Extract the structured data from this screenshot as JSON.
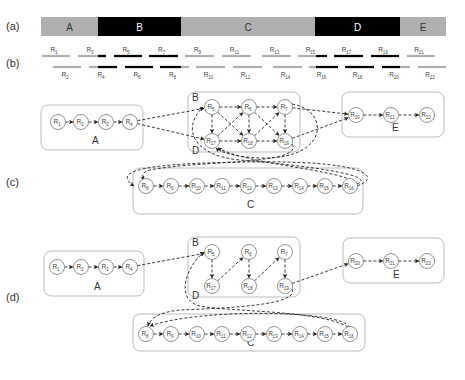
{
  "panels": {
    "a": {
      "label": "(a)",
      "bar": {
        "y": 17,
        "height": 19
      },
      "segments": [
        {
          "name": "A",
          "x0": 41,
          "x1": 98,
          "color": "#b0b0b0",
          "text_color": "#333333"
        },
        {
          "name": "B",
          "x0": 98,
          "x1": 181,
          "color": "#000000",
          "text_color": "#ffffff"
        },
        {
          "name": "C",
          "x0": 181,
          "x1": 315,
          "color": "#b0b0b0",
          "text_color": "#333333"
        },
        {
          "name": "D",
          "x0": 315,
          "x1": 400,
          "color": "#000000",
          "text_color": "#ffffff"
        },
        {
          "name": "E",
          "x0": 400,
          "x1": 446,
          "color": "#b0b0b0",
          "text_color": "#333333"
        }
      ]
    },
    "b": {
      "label": "(b)",
      "colors": {
        "repeat": "#000000",
        "unique": "#b0b0b0"
      },
      "reads": [
        {
          "id": "R",
          "sub": "1",
          "row": 0,
          "x0": 42,
          "x1": 70,
          "black": []
        },
        {
          "id": "R",
          "sub": "3",
          "row": 0,
          "x0": 78,
          "x1": 106,
          "black": [
            [
              98,
              106
            ]
          ]
        },
        {
          "id": "R",
          "sub": "5",
          "row": 0,
          "x0": 114,
          "x1": 142,
          "black": [
            [
              114,
              142
            ]
          ]
        },
        {
          "id": "R",
          "sub": "7",
          "row": 0,
          "x0": 149,
          "x1": 178,
          "black": [
            [
              149,
              178
            ]
          ]
        },
        {
          "id": "R",
          "sub": "9",
          "row": 0,
          "x0": 185,
          "x1": 214,
          "black": []
        },
        {
          "id": "R",
          "sub": "11",
          "row": 0,
          "x0": 222,
          "x1": 251,
          "black": []
        },
        {
          "id": "R",
          "sub": "13",
          "row": 0,
          "x0": 262,
          "x1": 291,
          "black": []
        },
        {
          "id": "R",
          "sub": "15",
          "row": 0,
          "x0": 298,
          "x1": 327,
          "black": [
            [
              316,
              327
            ]
          ]
        },
        {
          "id": "R",
          "sub": "17",
          "row": 0,
          "x0": 334,
          "x1": 363,
          "black": [
            [
              334,
              363
            ]
          ]
        },
        {
          "id": "R",
          "sub": "19",
          "row": 0,
          "x0": 371,
          "x1": 399,
          "black": [
            [
              371,
              399
            ]
          ]
        },
        {
          "id": "R",
          "sub": "21",
          "row": 0,
          "x0": 407,
          "x1": 435,
          "black": []
        },
        {
          "id": "R",
          "sub": "2",
          "row": 1,
          "x0": 53,
          "x1": 81,
          "black": []
        },
        {
          "id": "R",
          "sub": "4",
          "row": 1,
          "x0": 89,
          "x1": 117,
          "black": [
            [
              98,
              117
            ]
          ]
        },
        {
          "id": "R",
          "sub": "6",
          "row": 1,
          "x0": 125,
          "x1": 153,
          "black": [
            [
              125,
              153
            ]
          ]
        },
        {
          "id": "R",
          "sub": "8",
          "row": 1,
          "x0": 160,
          "x1": 189,
          "black": [
            [
              160,
              181
            ]
          ]
        },
        {
          "id": "R",
          "sub": "10",
          "row": 1,
          "x0": 196,
          "x1": 225,
          "black": []
        },
        {
          "id": "R",
          "sub": "12",
          "row": 1,
          "x0": 233,
          "x1": 262,
          "black": []
        },
        {
          "id": "R",
          "sub": "14",
          "row": 1,
          "x0": 273,
          "x1": 302,
          "black": []
        },
        {
          "id": "R",
          "sub": "16",
          "row": 1,
          "x0": 309,
          "x1": 338,
          "black": [
            [
              316,
              338
            ]
          ]
        },
        {
          "id": "R",
          "sub": "18",
          "row": 1,
          "x0": 345,
          "x1": 374,
          "black": [
            [
              345,
              374
            ]
          ]
        },
        {
          "id": "R",
          "sub": "20",
          "row": 1,
          "x0": 382,
          "x1": 410,
          "black": [
            [
              382,
              400
            ]
          ]
        },
        {
          "id": "R",
          "sub": "22",
          "row": 1,
          "x0": 418,
          "x1": 446,
          "black": []
        }
      ]
    },
    "c": {
      "label": "(c)",
      "groups": [
        {
          "name": "A",
          "x": 41,
          "y": 105,
          "w": 102,
          "h": 45,
          "lx": 92,
          "ly": 144
        },
        {
          "name": "B",
          "x": 188,
          "y": 92,
          "w": 112,
          "h": 60,
          "lx": 192,
          "ly": 101
        },
        {
          "name": "D",
          "x": 188,
          "y": 92,
          "w": 112,
          "h": 60,
          "lx": 192,
          "ly": 154,
          "hide_box": true
        },
        {
          "name": "E",
          "x": 342,
          "y": 92,
          "w": 102,
          "h": 45,
          "lx": 392,
          "ly": 131
        },
        {
          "name": "C",
          "x": 133,
          "y": 168,
          "w": 230,
          "h": 46,
          "lx": 247,
          "ly": 208
        }
      ],
      "nodes": [
        {
          "key": "1",
          "sub": "1",
          "x": 58,
          "y": 122
        },
        {
          "key": "2",
          "sub": "2",
          "x": 81,
          "y": 122
        },
        {
          "key": "3",
          "sub": "3",
          "x": 106,
          "y": 122
        },
        {
          "key": "4",
          "sub": "4",
          "x": 130,
          "y": 122
        },
        {
          "key": "5",
          "sub": "5",
          "x": 212,
          "y": 107
        },
        {
          "key": "6",
          "sub": "6",
          "x": 249,
          "y": 107
        },
        {
          "key": "7",
          "sub": "7",
          "x": 285,
          "y": 107
        },
        {
          "key": "17",
          "sub": "17",
          "x": 212,
          "y": 141
        },
        {
          "key": "18",
          "sub": "18",
          "x": 249,
          "y": 141
        },
        {
          "key": "19",
          "sub": "19",
          "x": 285,
          "y": 141
        },
        {
          "key": "20",
          "sub": "20",
          "x": 356,
          "y": 115
        },
        {
          "key": "21",
          "sub": "21",
          "x": 391,
          "y": 115
        },
        {
          "key": "22",
          "sub": "22",
          "x": 427,
          "y": 115
        },
        {
          "key": "8",
          "sub": "8",
          "x": 146,
          "y": 186
        },
        {
          "key": "9",
          "sub": "9",
          "x": 171,
          "y": 186
        },
        {
          "key": "10",
          "sub": "10",
          "x": 197,
          "y": 186
        },
        {
          "key": "11",
          "sub": "11",
          "x": 222,
          "y": 186
        },
        {
          "key": "12",
          "sub": "12",
          "x": 248,
          "y": 186
        },
        {
          "key": "13",
          "sub": "13",
          "x": 274,
          "y": 186
        },
        {
          "key": "14",
          "sub": "14",
          "x": 300,
          "y": 186
        },
        {
          "key": "15",
          "sub": "15",
          "x": 325,
          "y": 186
        },
        {
          "key": "16",
          "sub": "16",
          "x": 350,
          "y": 186
        }
      ],
      "edges": [
        [
          "1",
          "2"
        ],
        [
          "2",
          "3"
        ],
        [
          "3",
          "4"
        ],
        [
          "4",
          "5"
        ],
        [
          "4",
          "17"
        ],
        [
          "5",
          "6"
        ],
        [
          "6",
          "7"
        ],
        [
          "5",
          "17"
        ],
        [
          "6",
          "18"
        ],
        [
          "7",
          "19"
        ],
        [
          "17",
          "18"
        ],
        [
          "18",
          "19"
        ],
        [
          "5",
          "18"
        ],
        [
          "17",
          "6"
        ],
        [
          "6",
          "19"
        ],
        [
          "18",
          "7"
        ],
        [
          "7",
          "20"
        ],
        [
          "19",
          "20"
        ],
        [
          "20",
          "21"
        ],
        [
          "21",
          "22"
        ],
        [
          "8",
          "9"
        ],
        [
          "9",
          "10"
        ],
        [
          "10",
          "11"
        ],
        [
          "11",
          "12"
        ],
        [
          "12",
          "13"
        ],
        [
          "13",
          "14"
        ],
        [
          "14",
          "15"
        ],
        [
          "15",
          "16"
        ]
      ],
      "curves": [
        {
          "name": "16-to-8-loop",
          "d": "M 357 186 C 385 176, 360 160, 250 162 C 150 163, 110 170, 134 186"
        },
        {
          "name": "16-to-5",
          "d": "M 357 184 C 380 175, 300 165, 240 160 C 195 156, 180 130, 203 107"
        },
        {
          "name": "19-to-8",
          "d": "M 292 144 C 305 165, 200 160, 150 170 C 140 172, 143 178, 144 180"
        },
        {
          "name": "7-to-17",
          "d": "M 292 104 C 330 110, 330 160, 260 158 C 235 157, 220 152, 216 148"
        },
        {
          "name": "16-to-17",
          "d": "M 356 182 C 330 168, 250 165, 218 148"
        }
      ]
    },
    "d": {
      "label": "(d)",
      "groups": [
        {
          "name": "A",
          "x": 44,
          "y": 251,
          "w": 100,
          "h": 45,
          "lx": 94,
          "ly": 290
        },
        {
          "name": "B",
          "x": 188,
          "y": 237,
          "w": 112,
          "h": 60,
          "lx": 192,
          "ly": 246
        },
        {
          "name": "D",
          "x": 188,
          "y": 237,
          "w": 112,
          "h": 60,
          "lx": 192,
          "ly": 299,
          "hide_box": true
        },
        {
          "name": "E",
          "x": 343,
          "y": 238,
          "w": 101,
          "h": 45,
          "lx": 393,
          "ly": 278
        },
        {
          "name": "C",
          "x": 133,
          "y": 314,
          "w": 232,
          "h": 37,
          "lx": 247,
          "ly": 346
        }
      ],
      "nodes": [
        {
          "key": "1",
          "sub": "1",
          "x": 57,
          "y": 267
        },
        {
          "key": "2",
          "sub": "2",
          "x": 81,
          "y": 267
        },
        {
          "key": "3",
          "sub": "3",
          "x": 106,
          "y": 267
        },
        {
          "key": "4",
          "sub": "4",
          "x": 130,
          "y": 267
        },
        {
          "key": "5",
          "sub": "5",
          "x": 212,
          "y": 252
        },
        {
          "key": "6",
          "sub": "6",
          "x": 249,
          "y": 252
        },
        {
          "key": "7",
          "sub": "7",
          "x": 285,
          "y": 252
        },
        {
          "key": "17",
          "sub": "17",
          "x": 212,
          "y": 286
        },
        {
          "key": "18",
          "sub": "18",
          "x": 249,
          "y": 286
        },
        {
          "key": "19",
          "sub": "19",
          "x": 285,
          "y": 286
        },
        {
          "key": "20",
          "sub": "20",
          "x": 356,
          "y": 261
        },
        {
          "key": "21",
          "sub": "21",
          "x": 391,
          "y": 261
        },
        {
          "key": "22",
          "sub": "22",
          "x": 427,
          "y": 261
        },
        {
          "key": "8",
          "sub": "8",
          "x": 146,
          "y": 334
        },
        {
          "key": "9",
          "sub": "9",
          "x": 171,
          "y": 334
        },
        {
          "key": "10",
          "sub": "10",
          "x": 197,
          "y": 334
        },
        {
          "key": "11",
          "sub": "11",
          "x": 222,
          "y": 334
        },
        {
          "key": "12",
          "sub": "12",
          "x": 248,
          "y": 334
        },
        {
          "key": "13",
          "sub": "13",
          "x": 274,
          "y": 334
        },
        {
          "key": "14",
          "sub": "14",
          "x": 300,
          "y": 334
        },
        {
          "key": "15",
          "sub": "15",
          "x": 325,
          "y": 334
        },
        {
          "key": "16",
          "sub": "16",
          "x": 350,
          "y": 334
        }
      ],
      "edges": [
        [
          "1",
          "2"
        ],
        [
          "2",
          "3"
        ],
        [
          "3",
          "4"
        ],
        [
          "4",
          "5"
        ],
        [
          "5",
          "17"
        ],
        [
          "17",
          "6"
        ],
        [
          "6",
          "18"
        ],
        [
          "18",
          "7"
        ],
        [
          "7",
          "19"
        ],
        [
          "19",
          "20"
        ],
        [
          "20",
          "21"
        ],
        [
          "21",
          "22"
        ],
        [
          "8",
          "9"
        ],
        [
          "9",
          "10"
        ],
        [
          "10",
          "11"
        ],
        [
          "11",
          "12"
        ],
        [
          "12",
          "13"
        ],
        [
          "13",
          "14"
        ],
        [
          "14",
          "15"
        ],
        [
          "15",
          "16"
        ]
      ],
      "curves": [
        {
          "name": "16-to-8-top",
          "d": "M 350 327 C 340 310, 200 308, 150 326"
        },
        {
          "name": "19-to-8",
          "d": "M 292 289 C 300 305, 230 308, 180 310 C 160 312, 150 318, 148 326"
        },
        {
          "name": "16-to-5",
          "d": "M 348 327 C 320 310, 230 312, 200 306 C 175 300, 185 268, 204 252"
        }
      ]
    }
  }
}
